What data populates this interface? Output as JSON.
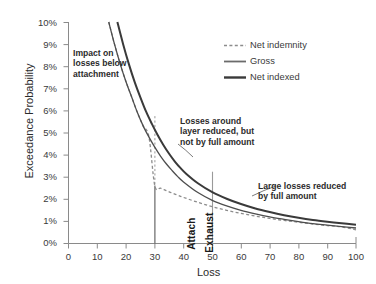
{
  "chart_data": {
    "type": "line",
    "title": "",
    "xlabel": "Loss",
    "ylabel": "Exceedance Probability",
    "xlim": [
      0,
      100
    ],
    "ylim": [
      0,
      0.1
    ],
    "grid": false,
    "legend_position": "top-right",
    "x_ticks": [
      "0",
      "10",
      "20",
      "30",
      "40",
      "50",
      "60",
      "70",
      "80",
      "90",
      "100"
    ],
    "x_tick_values": [
      0,
      10,
      20,
      30,
      40,
      50,
      60,
      70,
      80,
      90,
      100
    ],
    "y_ticks": [
      "0%",
      "1%",
      "2%",
      "3%",
      "4%",
      "5%",
      "6%",
      "7%",
      "8%",
      "9%",
      "10%"
    ],
    "y_tick_values": [
      0,
      1,
      2,
      3,
      4,
      5,
      6,
      7,
      8,
      9,
      10
    ],
    "series": [
      {
        "name": "Net indemnity",
        "style": "dashed",
        "color": "#8c8c8c",
        "width": 1.3,
        "x": [
          14,
          16,
          18,
          20,
          22,
          24,
          26,
          28,
          30,
          32,
          34,
          36,
          38,
          40,
          45,
          50,
          55,
          60,
          65,
          70,
          75,
          80,
          85,
          90,
          95,
          100
        ],
        "y": [
          10.0,
          9.0,
          8.1,
          7.3,
          6.6,
          5.9,
          5.3,
          4.8,
          2.62,
          2.5,
          2.39,
          2.28,
          2.18,
          2.08,
          1.86,
          1.66,
          1.5,
          1.36,
          1.24,
          1.13,
          1.04,
          0.96,
          0.88,
          0.81,
          0.75,
          0.62
        ]
      },
      {
        "name": "Gross",
        "style": "solid",
        "color": "#4d4d4d",
        "width": 1.3,
        "x": [
          14,
          16,
          18,
          20,
          22,
          24,
          26,
          28,
          30,
          32,
          34,
          36,
          38,
          40,
          45,
          50,
          55,
          60,
          65,
          70,
          75,
          80,
          85,
          90,
          95,
          100
        ],
        "y": [
          10.0,
          9.0,
          8.1,
          7.3,
          6.6,
          5.9,
          5.3,
          4.8,
          4.35,
          3.95,
          3.6,
          3.3,
          3.02,
          2.78,
          2.3,
          1.95,
          1.7,
          1.5,
          1.34,
          1.2,
          1.09,
          0.99,
          0.9,
          0.83,
          0.76,
          0.7
        ]
      },
      {
        "name": "Net indexed",
        "style": "solid",
        "color": "#3a3a3a",
        "width": 2.0,
        "x": [
          17,
          19,
          21,
          23,
          25,
          27,
          29,
          31,
          33,
          35,
          37,
          39,
          41,
          45,
          50,
          55,
          60,
          65,
          70,
          75,
          80,
          85,
          90,
          95,
          100
        ],
        "y": [
          10.0,
          9.0,
          8.1,
          7.3,
          6.6,
          5.95,
          5.4,
          4.9,
          4.45,
          4.05,
          3.7,
          3.4,
          3.14,
          2.72,
          2.32,
          2.02,
          1.78,
          1.58,
          1.42,
          1.28,
          1.16,
          1.06,
          0.98,
          0.91,
          0.85
        ]
      }
    ],
    "markers": [
      {
        "label": "Attach",
        "x": 30,
        "y_top": 5.72,
        "y_solid_top": 2.62
      },
      {
        "label": "Exhaust",
        "x": 50,
        "y_top": 3.25
      }
    ],
    "annotations": [
      {
        "name": "impact-below-attachment",
        "lines": [
          "Impact on",
          "losses below",
          "attachment"
        ]
      },
      {
        "name": "losses-around-layer",
        "lines": [
          "Losses around",
          "layer reduced, but",
          "not by full amount"
        ]
      },
      {
        "name": "large-losses-reduced",
        "lines": [
          "Large losses reduced",
          "by full amount"
        ]
      }
    ],
    "legend": [
      {
        "label": "Net indemnity",
        "style": "dashed",
        "color": "#8c8c8c"
      },
      {
        "label": "Gross",
        "style": "solid",
        "color": "#6b6b6b"
      },
      {
        "label": "Net indexed",
        "style": "solid",
        "color": "#3a3a3a"
      }
    ],
    "colors": {
      "axis": "#8a8a8a",
      "text": "#2b2b2b",
      "net_indemnity": "#8c8c8c",
      "gross": "#4d4d4d",
      "net_indexed": "#3a3a3a",
      "marker_line": "#9a9a9a"
    }
  }
}
